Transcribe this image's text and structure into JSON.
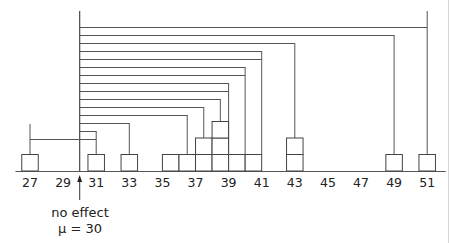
{
  "chart_data": {
    "type": "diagram",
    "axis": {
      "ticks": [
        27,
        29,
        31,
        33,
        35,
        37,
        39,
        41,
        43,
        45,
        47,
        49,
        51
      ],
      "min": 26,
      "max": 52
    },
    "reference": {
      "value": 30,
      "label_line1": "no effect",
      "label_line2": "μ = 30"
    },
    "stacks": [
      {
        "x": 27,
        "count": 1
      },
      {
        "x": 31,
        "count": 1
      },
      {
        "x": 33,
        "count": 1
      },
      {
        "x": 35.5,
        "count": 1
      },
      {
        "x": 36.5,
        "count": 1
      },
      {
        "x": 37.5,
        "count": 2
      },
      {
        "x": 38.5,
        "count": 3
      },
      {
        "x": 39.5,
        "count": 1
      },
      {
        "x": 40.5,
        "count": 1
      },
      {
        "x": 43,
        "count": 2
      },
      {
        "x": 49,
        "count": 1
      },
      {
        "x": 51,
        "count": 1
      }
    ],
    "brackets": [
      {
        "y": 27,
        "to": 51
      },
      {
        "y": 35,
        "to": 49
      },
      {
        "y": 43,
        "to": 43
      },
      {
        "y": 51,
        "to": 41
      },
      {
        "y": 59,
        "to": 41
      },
      {
        "y": 67,
        "to": 40
      },
      {
        "y": 75,
        "to": 40
      },
      {
        "y": 83,
        "to": 39
      },
      {
        "y": 91,
        "to": 39
      },
      {
        "y": 99,
        "to": 38.5
      },
      {
        "y": 107,
        "to": 37.5
      },
      {
        "y": 115,
        "to": 36.5
      },
      {
        "y": 123,
        "to": 33
      },
      {
        "y": 131,
        "to": 31
      },
      {
        "y": 139,
        "from": 27,
        "to": 31
      }
    ]
  }
}
